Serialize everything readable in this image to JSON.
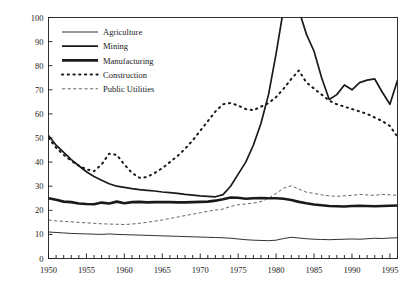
{
  "chart_data": {
    "type": "line",
    "title": "",
    "subtitle": "",
    "xlabel": "",
    "ylabel": "",
    "xlim": [
      1950,
      1996
    ],
    "ylim": [
      0,
      100
    ],
    "grid": false,
    "legend_position": "top-left",
    "x_ticks_major": [
      1950,
      1955,
      1960,
      1965,
      1970,
      1975,
      1980,
      1985,
      1990,
      1995
    ],
    "x_tick_labels": [
      "1950",
      "1955",
      "1960",
      "1965",
      "1970",
      "1975",
      "1980",
      "1985",
      "1990",
      "1995"
    ],
    "x_ticks_minor_step": 1,
    "y_ticks": [
      0,
      10,
      20,
      30,
      40,
      50,
      60,
      70,
      80,
      90,
      100
    ],
    "y_tick_labels": [
      "0",
      "10",
      "20",
      "30",
      "40",
      "50",
      "60",
      "70",
      "80",
      "90",
      "100"
    ],
    "x": [
      1950,
      1951,
      1952,
      1953,
      1954,
      1955,
      1956,
      1957,
      1958,
      1959,
      1960,
      1961,
      1962,
      1963,
      1964,
      1965,
      1966,
      1967,
      1968,
      1969,
      1970,
      1971,
      1972,
      1973,
      1974,
      1975,
      1976,
      1977,
      1978,
      1979,
      1980,
      1981,
      1982,
      1983,
      1984,
      1985,
      1986,
      1987,
      1988,
      1989,
      1990,
      1991,
      1992,
      1993,
      1994,
      1995,
      1996
    ],
    "series": [
      {
        "name": "Agriculture",
        "style": "solid-thin",
        "color": "#1a1a1a",
        "width": 0.9,
        "values": [
          11.0,
          10.8,
          10.6,
          10.4,
          10.3,
          10.2,
          10.1,
          10.0,
          10.2,
          10.0,
          9.9,
          9.8,
          9.7,
          9.6,
          9.5,
          9.4,
          9.3,
          9.2,
          9.1,
          9.0,
          8.9,
          8.8,
          8.7,
          8.6,
          8.4,
          8.1,
          7.8,
          7.6,
          7.5,
          7.4,
          7.6,
          8.3,
          8.8,
          8.5,
          8.2,
          8.0,
          7.9,
          7.8,
          7.9,
          8.0,
          8.1,
          8.0,
          8.2,
          8.4,
          8.3,
          8.5,
          8.6
        ]
      },
      {
        "name": "Mining",
        "style": "solid-medium",
        "color": "#1a1a1a",
        "width": 1.7,
        "values": [
          51.0,
          47.0,
          44.0,
          41.0,
          38.5,
          36.0,
          34.0,
          32.5,
          31.0,
          30.0,
          29.5,
          29.0,
          28.6,
          28.3,
          28.0,
          27.6,
          27.3,
          27.0,
          26.6,
          26.3,
          26.0,
          25.8,
          25.6,
          26.5,
          30.0,
          35.0,
          40.0,
          47.0,
          56.0,
          68.0,
          85.0,
          104.0,
          112.0,
          103.0,
          93.0,
          86.0,
          75.0,
          66.0,
          68.0,
          72.0,
          70.0,
          73.0,
          74.0,
          74.5,
          69.0,
          64.0,
          74.0
        ]
      },
      {
        "name": "Manufacturing",
        "style": "solid-thick",
        "color": "#1a1a1a",
        "width": 2.6,
        "values": [
          25.0,
          24.4,
          23.6,
          23.4,
          22.8,
          22.6,
          22.5,
          23.2,
          22.8,
          23.6,
          22.9,
          23.4,
          23.5,
          23.3,
          23.4,
          23.4,
          23.4,
          23.3,
          23.3,
          23.4,
          23.5,
          23.6,
          24.0,
          24.6,
          25.3,
          25.2,
          24.8,
          25.0,
          25.1,
          25.0,
          25.0,
          24.8,
          24.3,
          23.5,
          22.9,
          22.4,
          22.1,
          21.8,
          21.7,
          21.6,
          21.8,
          21.9,
          21.8,
          21.7,
          21.8,
          21.9,
          22.0
        ]
      },
      {
        "name": "Construction",
        "style": "dotted-bold",
        "color": "#1a1a1a",
        "width": 2.0,
        "values": [
          50.0,
          46.0,
          43.0,
          40.5,
          38.5,
          37.0,
          36.2,
          39.0,
          43.5,
          43.0,
          39.0,
          35.5,
          33.5,
          33.8,
          35.5,
          37.5,
          40.0,
          42.5,
          45.5,
          49.0,
          53.0,
          57.0,
          61.0,
          64.0,
          64.5,
          63.5,
          62.0,
          61.5,
          63.0,
          64.5,
          67.0,
          70.5,
          74.5,
          78.0,
          73.0,
          70.5,
          68.0,
          65.5,
          64.0,
          63.0,
          62.0,
          61.0,
          60.0,
          58.5,
          57.0,
          55.0,
          50.5
        ]
      },
      {
        "name": "Public Utilities",
        "style": "dashed-light",
        "color": "#555555",
        "width": 0.9,
        "values": [
          16.0,
          15.6,
          15.4,
          15.2,
          15.0,
          14.8,
          14.6,
          14.4,
          14.3,
          14.2,
          14.1,
          14.3,
          14.6,
          15.0,
          15.5,
          16.0,
          16.6,
          17.2,
          17.8,
          18.4,
          19.0,
          19.6,
          20.1,
          20.5,
          21.6,
          22.3,
          22.6,
          23.0,
          23.6,
          25.0,
          27.0,
          29.2,
          30.2,
          28.8,
          27.5,
          27.0,
          26.4,
          26.0,
          25.8,
          26.0,
          26.2,
          26.6,
          26.4,
          26.2,
          26.6,
          26.4,
          26.2
        ]
      }
    ],
    "annotations": [
      {
        "text": "Mining exceeds axis maximum between 1981 and 1982",
        "visible": false
      }
    ]
  },
  "legend": {
    "entries": [
      {
        "label": "Agriculture"
      },
      {
        "label": "Mining"
      },
      {
        "label": "Manufacturing"
      },
      {
        "label": "Construction"
      },
      {
        "label": "Public Utilities"
      }
    ]
  }
}
